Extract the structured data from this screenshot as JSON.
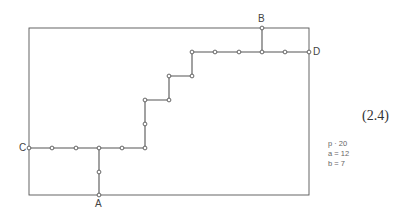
{
  "diagram": {
    "equation_number": "(2.4)",
    "labels": {
      "A": "A",
      "B": "B",
      "C": "C",
      "D": "D"
    },
    "parameters": [
      {
        "text": "p · 20"
      },
      {
        "text": "a = 12"
      },
      {
        "text": "b = 7"
      }
    ],
    "colors": {
      "line": "#555555",
      "node_fill": "#ffffff",
      "node_stroke": "#555555"
    },
    "boundary": {
      "left": 29,
      "top": 28,
      "right": 309,
      "bottom": 195
    },
    "path_nodes": [
      [
        29,
        148
      ],
      [
        52,
        148
      ],
      [
        76,
        148
      ],
      [
        99,
        148
      ],
      [
        122,
        148
      ],
      [
        145,
        148
      ],
      [
        145,
        124
      ],
      [
        145,
        100
      ],
      [
        169,
        100
      ],
      [
        169,
        76
      ],
      [
        192,
        76
      ],
      [
        192,
        52
      ],
      [
        215,
        52
      ],
      [
        239,
        52
      ],
      [
        262,
        52
      ],
      [
        285,
        52
      ],
      [
        309,
        52
      ]
    ],
    "branch_A_nodes": [
      [
        99,
        148
      ],
      [
        99,
        172
      ],
      [
        99,
        195
      ]
    ],
    "branch_B_nodes": [
      [
        262,
        52
      ],
      [
        262,
        28
      ]
    ]
  }
}
